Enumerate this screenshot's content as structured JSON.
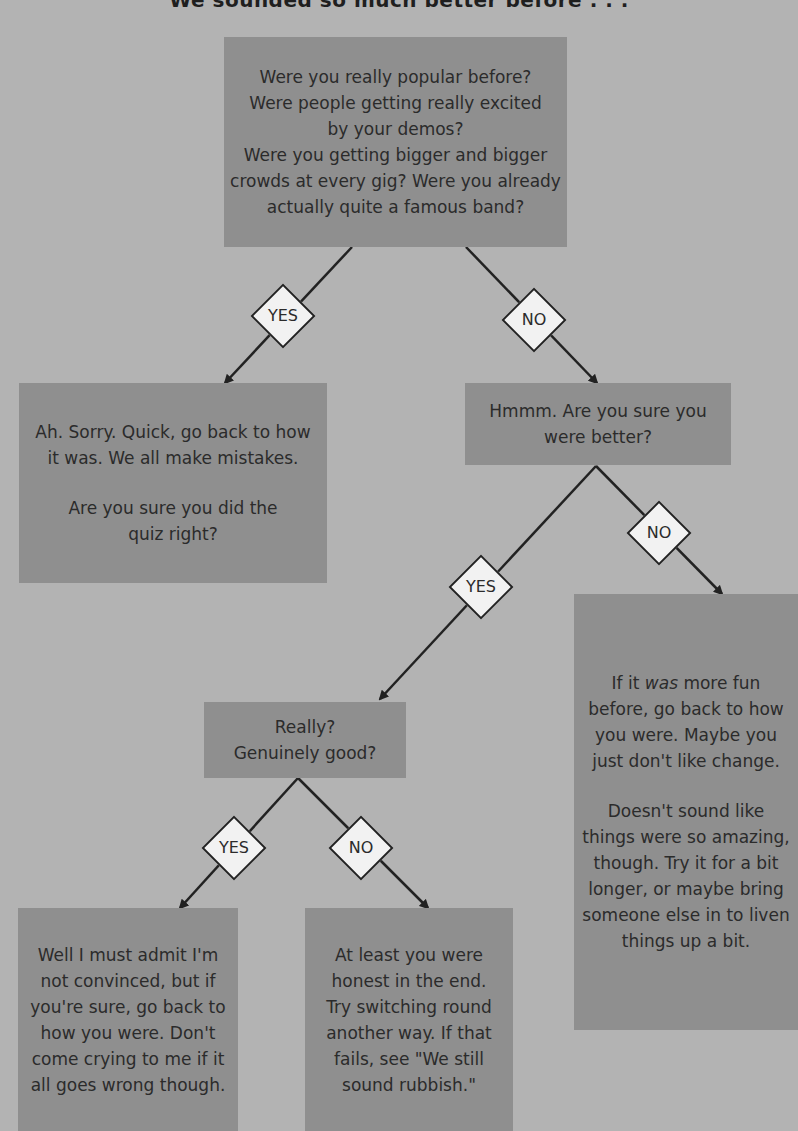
{
  "title": "We sounded so much better before . . .",
  "nodes": {
    "start": {
      "lines": [
        "Were you really popular before?",
        "Were people getting really excited",
        "by your demos?",
        "Were you getting bigger and bigger",
        "crowds at every gig? Were you already",
        "actually quite a famous band?"
      ]
    },
    "yes_popular": {
      "para1": [
        "Ah. Sorry. Quick, go back to how",
        "it was. We all make mistakes."
      ],
      "para2": [
        "Are you sure you did the",
        "quiz right?"
      ]
    },
    "no_popular": {
      "lines": [
        "Hmmm. Are you sure you",
        "were better?"
      ]
    },
    "really": {
      "lines": [
        "Really?",
        "Genuinely good?"
      ]
    },
    "no_better": {
      "para1_prefix": "If it ",
      "para1_em": "was",
      "para1_suffix": " more fun",
      "para1": [
        "before, go back to how",
        "you were. Maybe you",
        "just don't like change."
      ],
      "para2": [
        "Doesn't sound like",
        "things were so amazing,",
        "though. Try it for a bit",
        "longer, or maybe bring",
        "someone else in to liven",
        "things up a bit."
      ]
    },
    "yes_genuine": {
      "lines": [
        "Well I must admit I'm",
        "not convinced, but if",
        "you're sure, go back to",
        "how you were. Don't",
        "come crying to me if it",
        "all goes wrong though."
      ]
    },
    "no_genuine": {
      "lines": [
        "At least you were",
        "honest in the end.",
        "Try switching round",
        "another way. If that",
        "fails, see \"We still",
        "sound rubbish.\""
      ]
    }
  },
  "decisions": {
    "d1_yes": "YES",
    "d1_no": "NO",
    "d2_yes": "YES",
    "d2_no": "NO",
    "d3_yes": "YES",
    "d3_no": "NO"
  },
  "colors": {
    "background": "#b3b3b3",
    "box": "#8f8f8f",
    "diamond": "#f2f2f2",
    "line": "#222222"
  }
}
